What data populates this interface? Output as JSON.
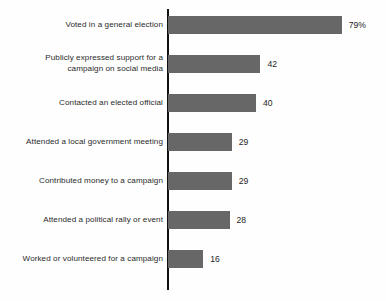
{
  "chart_data": {
    "type": "bar",
    "orientation": "horizontal",
    "title": "",
    "subtitle": "",
    "xlabel": "",
    "ylabel": "",
    "xlim": [
      0,
      100
    ],
    "grid": false,
    "legend": null,
    "value_suffix_first": "%",
    "categories": [
      "Voted in a general election",
      "Publicly expressed support for a\ncampaign on social media",
      "Contacted an elected official",
      "Attended a local government meeting",
      "Contributed money to a campaign",
      "Attended a political rally or event",
      "Worked or volunteered for a campaign"
    ],
    "values": [
      79,
      42,
      40,
      29,
      29,
      28,
      16
    ],
    "value_labels": [
      "79%",
      "42",
      "40",
      "29",
      "29",
      "28",
      "16"
    ],
    "colors": {
      "bar": "#676767",
      "axis": "#111111",
      "label_text": "#2b2b2b",
      "value_text": "#1f1f1f",
      "background": "#fefefe"
    }
  },
  "rows": [
    {
      "label": "Voted in a general election",
      "value": 79,
      "value_label": "79%"
    },
    {
      "label": "Publicly expressed support for a\ncampaign on social media",
      "value": 42,
      "value_label": "42"
    },
    {
      "label": "Contacted an elected official",
      "value": 40,
      "value_label": "40"
    },
    {
      "label": "Attended a local government meeting",
      "value": 29,
      "value_label": "29"
    },
    {
      "label": "Contributed money to a campaign",
      "value": 29,
      "value_label": "29"
    },
    {
      "label": "Attended a political rally or event",
      "value": 28,
      "value_label": "28"
    },
    {
      "label": "Worked or volunteered for a campaign",
      "value": 16,
      "value_label": "16"
    }
  ]
}
